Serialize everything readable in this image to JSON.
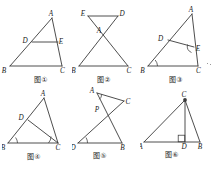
{
  "page": {
    "background_color": "#ffffff",
    "line_color": "#3a3a3a",
    "label_color": "#1a1a1a",
    "width": 218,
    "height": 170
  },
  "figures": [
    {
      "id": "fig1",
      "caption": "图①",
      "description": "Triangle ABC with D on AB and E on AC, segment DE parallel to BC",
      "vertices": [
        {
          "name": "A",
          "x": 52,
          "y": 14,
          "label_dx": -1,
          "label_dy": -2.5
        },
        {
          "name": "B",
          "x": 10,
          "y": 62,
          "label_dx": -6,
          "label_dy": 6.5
        },
        {
          "name": "C",
          "x": 62,
          "y": 62,
          "label_dx": 0.5,
          "label_dy": 6.5
        },
        {
          "name": "D",
          "x": 32,
          "y": 38,
          "label_dx": -7,
          "label_dy": 0.5
        },
        {
          "name": "E",
          "x": 58,
          "y": 38,
          "label_dx": 2,
          "label_dy": 1.5
        }
      ],
      "segments": [
        {
          "from": "A",
          "to": "B"
        },
        {
          "from": "B",
          "to": "C"
        },
        {
          "from": "C",
          "to": "A"
        },
        {
          "from": "D",
          "to": "E"
        }
      ],
      "angle_marks": []
    },
    {
      "id": "fig2",
      "caption": "图②",
      "description": "Bowtie: segments EC and DB cross at A above base BC, with ED on top",
      "vertices": [
        {
          "name": "E",
          "x": 16,
          "y": 12,
          "label_dx": -6.5,
          "label_dy": 1
        },
        {
          "name": "D",
          "x": 46,
          "y": 12,
          "label_dx": 2,
          "label_dy": 1
        },
        {
          "name": "A",
          "x": 29,
          "y": 30,
          "label_dx": -2,
          "label_dy": -1.5
        },
        {
          "name": "B",
          "x": 7,
          "y": 62,
          "label_dx": -6,
          "label_dy": 6.5
        },
        {
          "name": "C",
          "x": 56,
          "y": 62,
          "label_dx": 0.5,
          "label_dy": 6.5
        }
      ],
      "segments": [
        {
          "from": "E",
          "to": "D"
        },
        {
          "from": "E",
          "to": "C"
        },
        {
          "from": "D",
          "to": "B"
        },
        {
          "from": "B",
          "to": "C"
        }
      ],
      "angle_marks": []
    },
    {
      "id": "fig3",
      "caption": "图③",
      "description": "Triangle ABC with D on AB, E on AC, segment DE, right angle marked at E and angle arc at B",
      "vertices": [
        {
          "name": "A",
          "x": 52,
          "y": 10,
          "label_dx": -1,
          "label_dy": -2.5
        },
        {
          "name": "B",
          "x": 8,
          "y": 62,
          "label_dx": -6,
          "label_dy": 6.5
        },
        {
          "name": "C",
          "x": 58,
          "y": 62,
          "label_dx": 0.5,
          "label_dy": 6.5
        },
        {
          "name": "D",
          "x": 28,
          "y": 36,
          "label_dx": -7.5,
          "label_dy": 0.5
        },
        {
          "name": "E",
          "x": 54,
          "y": 43,
          "label_dx": 2,
          "label_dy": 3
        }
      ],
      "segments": [
        {
          "from": "A",
          "to": "B"
        },
        {
          "from": "B",
          "to": "C"
        },
        {
          "from": "C",
          "to": "A"
        },
        {
          "from": "D",
          "to": "E"
        },
        {
          "from": "E",
          "to": "C"
        }
      ],
      "angle_marks": [
        {
          "at": "B",
          "type": "arc"
        },
        {
          "at": "E",
          "type": "right-angle"
        }
      ]
    },
    {
      "id": "fig4",
      "caption": "图④",
      "description": "Triangle ABC with D on AB and cevian DC, angle arcs at B and C",
      "vertices": [
        {
          "name": "A",
          "x": 42,
          "y": 10,
          "label_dx": -1,
          "label_dy": -2.5
        },
        {
          "name": "B",
          "x": 6,
          "y": 55,
          "label_dx": -5.5,
          "label_dy": 7
        },
        {
          "name": "C",
          "x": 56,
          "y": 55,
          "label_dx": 0,
          "label_dy": 7
        },
        {
          "name": "D",
          "x": 26,
          "y": 32,
          "label_dx": -7,
          "label_dy": 0
        }
      ],
      "segments": [
        {
          "from": "A",
          "to": "B"
        },
        {
          "from": "B",
          "to": "C"
        },
        {
          "from": "C",
          "to": "A"
        },
        {
          "from": "D",
          "to": "C"
        }
      ],
      "angle_marks": [
        {
          "at": "B",
          "type": "arc"
        },
        {
          "at": "C",
          "type": "arc"
        }
      ]
    },
    {
      "id": "fig5",
      "caption": "图⑤",
      "description": "Segments AB and DC cross at P above base DB; angle marked at A and arc at D",
      "vertices": [
        {
          "name": "A",
          "x": 25,
          "y": 8,
          "label_dx": -6,
          "label_dy": 0
        },
        {
          "name": "C",
          "x": 52,
          "y": 16,
          "label_dx": 2,
          "label_dy": 2
        },
        {
          "name": "P",
          "x": 31,
          "y": 26,
          "label_dx": -6.5,
          "label_dy": 1
        },
        {
          "name": "D",
          "x": 6,
          "y": 58,
          "label_dx": -5.5,
          "label_dy": 7
        },
        {
          "name": "B",
          "x": 50,
          "y": 58,
          "label_dx": 0.5,
          "label_dy": 7
        }
      ],
      "segments": [
        {
          "from": "A",
          "to": "C"
        },
        {
          "from": "A",
          "to": "B"
        },
        {
          "from": "D",
          "to": "C"
        },
        {
          "from": "D",
          "to": "B"
        }
      ],
      "angle_marks": [
        {
          "at": "A",
          "type": "right-angle"
        },
        {
          "at": "D",
          "type": "arc"
        }
      ]
    },
    {
      "id": "fig6",
      "caption": "图⑥",
      "description": "Triangle ABC with altitude CD perpendicular to AB, right angle marked at D",
      "vertices": [
        {
          "name": "C",
          "x": 45,
          "y": 10,
          "label_dx": -1,
          "label_dy": -2.5
        },
        {
          "name": "A",
          "x": 4,
          "y": 52,
          "label_dx": -5.5,
          "label_dy": 7
        },
        {
          "name": "D",
          "x": 45,
          "y": 52,
          "label_dx": -1.5,
          "label_dy": 7
        },
        {
          "name": "B",
          "x": 60,
          "y": 52,
          "label_dx": 0.5,
          "label_dy": 7
        }
      ],
      "segments": [
        {
          "from": "A",
          "to": "C"
        },
        {
          "from": "C",
          "to": "B"
        },
        {
          "from": "A",
          "to": "B"
        },
        {
          "from": "C",
          "to": "D"
        }
      ],
      "angle_marks": [
        {
          "at": "D",
          "type": "right-angle"
        }
      ]
    }
  ]
}
